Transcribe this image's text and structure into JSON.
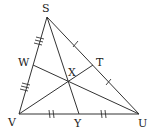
{
  "diagram": {
    "type": "triangle with cevians",
    "points": {
      "S": {
        "label": "S",
        "x": 47,
        "y": 17
      },
      "V": {
        "label": "V",
        "x": 19,
        "y": 114
      },
      "U": {
        "label": "U",
        "x": 139,
        "y": 114
      },
      "W": {
        "label": "W",
        "x": 33,
        "y": 65
      },
      "T": {
        "label": "T",
        "x": 93,
        "y": 65
      },
      "Y": {
        "label": "Y",
        "x": 79,
        "y": 114
      },
      "X": {
        "label": "X",
        "x": 68,
        "y": 83
      }
    },
    "segments": [
      "SV",
      "SU",
      "VU",
      "SY",
      "VT",
      "UW"
    ],
    "tick_marks": {
      "SW": 3,
      "WV": 3,
      "ST": 1,
      "TU": 1,
      "VY": 2,
      "YU": 2
    },
    "colors": {
      "line": "#333333",
      "text": "#222222",
      "background": "#ffffff"
    }
  }
}
